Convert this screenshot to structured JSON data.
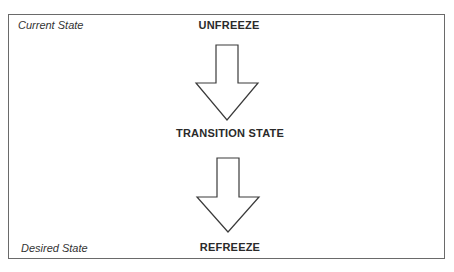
{
  "diagram": {
    "corner_labels": {
      "top_left": "Current State",
      "bottom_left": "Desired State"
    },
    "stages": [
      {
        "label": "UNFREEZE"
      },
      {
        "label": "TRANSITION STATE"
      },
      {
        "label": "REFREEZE"
      }
    ],
    "colors": {
      "border": "#6a6a6a",
      "arrow_stroke": "#3a3a3a",
      "text": "#2a2a2a"
    }
  }
}
